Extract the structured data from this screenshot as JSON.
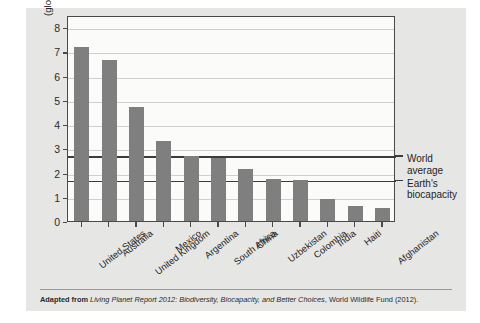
{
  "chart_data": {
    "type": "bar",
    "title": "",
    "xlabel": "",
    "ylabel": "Ecological footprint (global hectares per person)",
    "ylabel_line1": "Ecological footprint",
    "ylabel_line2": "(global hectares per person)",
    "ylim": [
      0,
      8.5
    ],
    "ytick_labels": [
      "0",
      "1",
      "2",
      "3",
      "4",
      "5",
      "6",
      "7",
      "8"
    ],
    "ytick_values": [
      0,
      1,
      2,
      3,
      4,
      5,
      6,
      7,
      8
    ],
    "grid": true,
    "legend": "none",
    "categories": [
      "United States",
      "Australia",
      "United Kingdom",
      "Mexico",
      "Argentina",
      "South Africa",
      "China",
      "Uzbekistan",
      "Colombia",
      "India",
      "Haiti",
      "Afghanistan"
    ],
    "values": [
      7.2,
      6.65,
      4.7,
      3.3,
      2.7,
      2.6,
      2.15,
      1.75,
      1.7,
      0.9,
      0.6,
      0.55
    ],
    "bar_color": "#807f7f",
    "reference_lines": [
      {
        "label_line1": "World",
        "label_line2": "average",
        "value": 2.75
      },
      {
        "label_line1": "Earth's",
        "label_line2": "biocapacity",
        "value": 1.75
      }
    ]
  },
  "caption": {
    "prefix": "Adapted from ",
    "source_italic": "Living Planet Report 2012: Biodiversity, Biocapacity, and Better Choices",
    "suffix": ", World Wildlife Fund (2012)."
  }
}
